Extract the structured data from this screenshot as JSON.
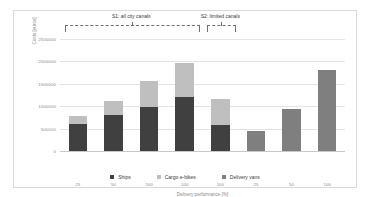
{
  "chart_data": {
    "type": "bar",
    "stacked": true,
    "title": "",
    "xlabel": "Delivery performance [%]",
    "ylabel": "Costs [euros]",
    "ylim": [
      0,
      2500000
    ],
    "yticks": [
      0,
      500000,
      1000000,
      1500000,
      2000000,
      2500000
    ],
    "ytick_labels": [
      "0",
      "500000",
      "1000000",
      "1500000",
      "2000000",
      "2500000"
    ],
    "grid": true,
    "legend_position": "bottom",
    "categories": [
      "25",
      "50",
      "100",
      "100",
      "100",
      "25",
      "50",
      "100"
    ],
    "series": [
      {
        "name": "Ships",
        "color": "#404040",
        "values": [
          600000,
          800000,
          990000,
          1200000,
          570000,
          0,
          0,
          0
        ]
      },
      {
        "name": "Cargo e-bikes",
        "color": "#bfbfbf",
        "values": [
          175000,
          325000,
          580000,
          760000,
          600000,
          0,
          0,
          0
        ]
      },
      {
        "name": "Delivery vans",
        "color": "#7f7f7f",
        "values": [
          0,
          0,
          0,
          0,
          0,
          450000,
          930000,
          1800000
        ]
      }
    ],
    "totals": [
      775000,
      1125000,
      1570000,
      1960000,
      1170000,
      450000,
      930000,
      1800000
    ],
    "annotations": [
      {
        "name": "S1",
        "label": "S1: all city canals",
        "from_category_index": 0,
        "to_category_index": 3
      },
      {
        "name": "S2",
        "label": "S2: limited canals",
        "from_category_index": 4,
        "to_category_index": 4
      }
    ]
  },
  "legend": {
    "items": [
      {
        "label": "Ships"
      },
      {
        "label": "Cargo e-bikes"
      },
      {
        "label": "Delivery vans"
      }
    ]
  }
}
